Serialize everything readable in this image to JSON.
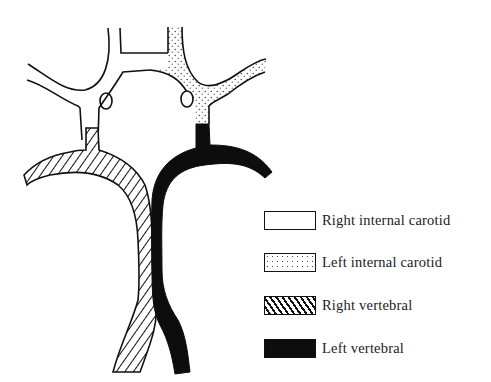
{
  "diagram": {
    "regions": [
      {
        "id": "right-internal-carotid",
        "fill": "white"
      },
      {
        "id": "left-internal-carotid",
        "fill": "stippled"
      },
      {
        "id": "right-vertebral",
        "fill": "hatched"
      },
      {
        "id": "left-vertebral",
        "fill": "black"
      }
    ]
  },
  "legend": {
    "items": [
      {
        "label": "Right internal carotid",
        "pattern": "white"
      },
      {
        "label": "Left internal carotid",
        "pattern": "stippled"
      },
      {
        "label": "Right vertebral",
        "pattern": "hatched"
      },
      {
        "label": "Left vertebral",
        "pattern": "black"
      }
    ]
  },
  "colors": {
    "ink": "#111111",
    "background": "#ffffff"
  }
}
